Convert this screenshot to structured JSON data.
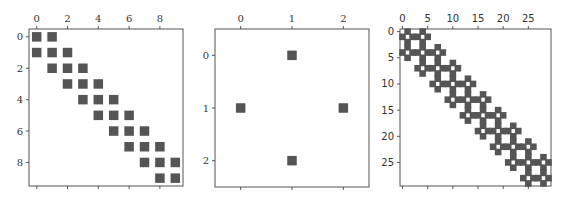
{
  "chart_data": [
    {
      "type": "heatmap",
      "subtype": "sparsity-pattern (spy plot)",
      "title": "",
      "shape": [
        10,
        10
      ],
      "xticks": [
        0,
        2,
        4,
        6,
        8
      ],
      "yticks": [
        0,
        2,
        4,
        6,
        8
      ],
      "xlabel": "",
      "ylabel": "",
      "xlim": [
        -0.5,
        9.5
      ],
      "ylim": [
        9.5,
        -0.5
      ],
      "xaxis_position": "top",
      "grid": false,
      "marker_color": "#555555",
      "nonzeros": [
        [
          0,
          0
        ],
        [
          0,
          1
        ],
        [
          1,
          0
        ],
        [
          1,
          1
        ],
        [
          1,
          2
        ],
        [
          2,
          1
        ],
        [
          2,
          2
        ],
        [
          2,
          3
        ],
        [
          3,
          2
        ],
        [
          3,
          3
        ],
        [
          3,
          4
        ],
        [
          4,
          3
        ],
        [
          4,
          4
        ],
        [
          4,
          5
        ],
        [
          5,
          4
        ],
        [
          5,
          5
        ],
        [
          5,
          6
        ],
        [
          6,
          5
        ],
        [
          6,
          6
        ],
        [
          6,
          7
        ],
        [
          7,
          6
        ],
        [
          7,
          7
        ],
        [
          7,
          8
        ],
        [
          8,
          7
        ],
        [
          8,
          8
        ],
        [
          8,
          9
        ],
        [
          9,
          8
        ],
        [
          9,
          9
        ]
      ],
      "font": "serif"
    },
    {
      "type": "heatmap",
      "subtype": "sparsity-pattern (spy plot)",
      "title": "",
      "shape": [
        3,
        3
      ],
      "xticks": [
        0,
        1,
        2
      ],
      "yticks": [
        0,
        1,
        2
      ],
      "xlabel": "",
      "ylabel": "",
      "xlim": [
        -0.5,
        2.5
      ],
      "ylim": [
        2.5,
        -0.5
      ],
      "xaxis_position": "top",
      "grid": false,
      "marker_color": "#555555",
      "nonzeros": [
        [
          0,
          1
        ],
        [
          1,
          0
        ],
        [
          1,
          2
        ],
        [
          2,
          1
        ]
      ],
      "font": "serif"
    },
    {
      "type": "heatmap",
      "subtype": "sparsity-pattern (spy plot), kron(tridiagonal 10x10, 3x3 cross)",
      "title": "",
      "shape": [
        30,
        30
      ],
      "xticks": [
        0,
        5,
        10,
        15,
        20,
        25
      ],
      "yticks": [
        0,
        5,
        10,
        15,
        20,
        25
      ],
      "xlabel": "",
      "ylabel": "",
      "xlim": [
        -0.5,
        29.5
      ],
      "ylim": [
        29.5,
        -0.5
      ],
      "xaxis_position": "top",
      "grid": false,
      "marker_color": "#555555",
      "block_pattern": {
        "outer_nonzeros": "tridiagonal |I-J|<=1 on 10x10",
        "inner_nonzeros": [
          [
            0,
            1
          ],
          [
            1,
            0
          ],
          [
            1,
            2
          ],
          [
            2,
            1
          ]
        ]
      },
      "font": "sans"
    }
  ],
  "plots": [
    {
      "frame": {
        "x": 29,
        "y": 29,
        "w": 154,
        "h": 157
      },
      "marker_size": 9.5,
      "label_class": "lbl-serif"
    },
    {
      "frame": {
        "x": 215,
        "y": 29,
        "w": 154,
        "h": 158
      },
      "marker_size": 9.5,
      "label_class": "lbl-serif"
    },
    {
      "frame": {
        "x": 400,
        "y": 29,
        "w": 151,
        "h": 157
      },
      "marker_size": 6.6,
      "label_class": "lbl-sans"
    }
  ]
}
